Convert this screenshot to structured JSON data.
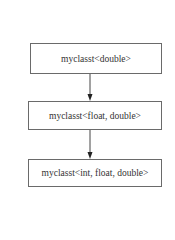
{
  "diagram": {
    "type": "inheritance-chain",
    "nodes": [
      {
        "id": "n1",
        "label": "myclasst<double>"
      },
      {
        "id": "n2",
        "label": "myclasst<float, double>"
      },
      {
        "id": "n3",
        "label": "myclasst<int, float, double>"
      }
    ],
    "edges": [
      {
        "from": "n1",
        "to": "n2",
        "style": "arrow"
      },
      {
        "from": "n2",
        "to": "n3",
        "style": "arrow"
      }
    ]
  },
  "colors": {
    "border": "#6a6a6a",
    "text": "#333333",
    "arrow": "#333333",
    "background": "#ffffff"
  }
}
